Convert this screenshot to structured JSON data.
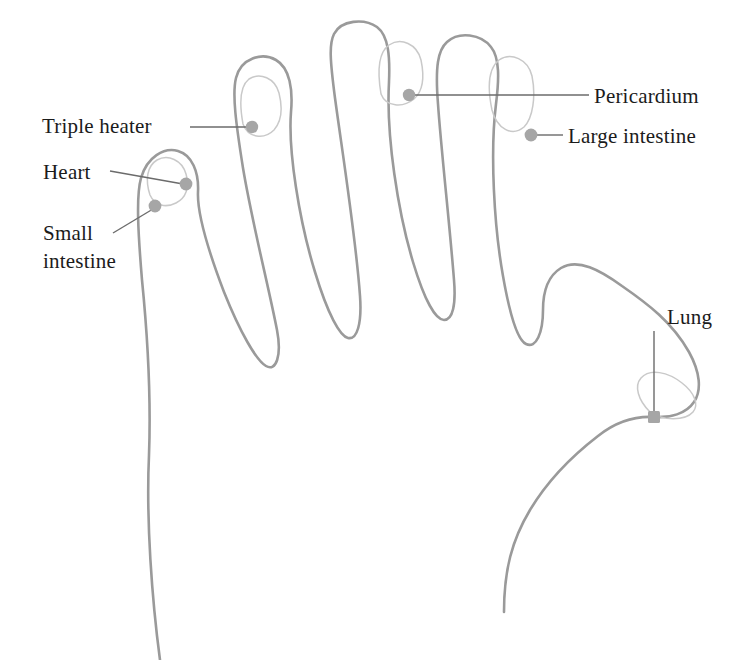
{
  "figure": {
    "type": "anatomical-diagram",
    "background_color": "#ffffff",
    "outline_color": "#9a9a9a",
    "nail_color": "#c9c9c9",
    "point_color": "#a6a6a6",
    "leader_color": "#6b6b6b",
    "text_color": "#1b1b1b"
  },
  "labels": {
    "triple_heater": "Triple heater",
    "heart": "Heart",
    "small_intestine_line1": "Small",
    "small_intestine_line2": "intestine",
    "pericardium": "Pericardium",
    "large_intestine": "Large intestine",
    "lung": "Lung"
  },
  "points": [
    {
      "name": "triple-heater-point",
      "label": "Triple heater",
      "finger": "middle finger",
      "x": 252,
      "y": 127
    },
    {
      "name": "heart-point",
      "label": "Heart",
      "finger": "little finger",
      "x": 186,
      "y": 184
    },
    {
      "name": "small-intestine-point",
      "label": "Small intestine",
      "finger": "little finger",
      "x": 155,
      "y": 206
    },
    {
      "name": "pericardium-point",
      "label": "Pericardium",
      "finger": "ring finger",
      "x": 409,
      "y": 95
    },
    {
      "name": "large-intestine-point",
      "label": "Large intestine",
      "finger": "index finger",
      "x": 531,
      "y": 135
    },
    {
      "name": "lung-point",
      "label": "Lung",
      "finger": "thumb",
      "x": 654,
      "y": 417
    }
  ],
  "leaders": [
    {
      "name": "triple-heater-leader",
      "from": [
        190,
        127
      ],
      "to": [
        248,
        127
      ]
    },
    {
      "name": "heart-leader",
      "from": [
        110,
        172
      ],
      "to": [
        182,
        184
      ]
    },
    {
      "name": "small-intestine-leader",
      "from": [
        113,
        232
      ],
      "to": [
        152,
        209
      ]
    },
    {
      "name": "pericardium-leader",
      "from": [
        412,
        95
      ],
      "to": [
        588,
        95
      ]
    },
    {
      "name": "large-intestine-leader",
      "from": [
        534,
        135
      ],
      "to": [
        562,
        135
      ]
    },
    {
      "name": "lung-leader",
      "from": [
        654,
        332
      ],
      "to": [
        654,
        414
      ]
    }
  ]
}
